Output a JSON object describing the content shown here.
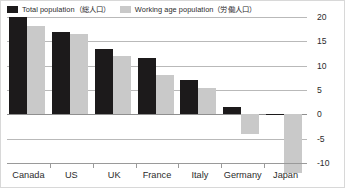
{
  "legend": {
    "position": "top-left",
    "entries": [
      {
        "label": "Total population（総人口）",
        "color": "#1c1a1b",
        "key": "total"
      },
      {
        "label": "Working age population（労働人口）",
        "color": "#c9c9c9",
        "key": "working"
      }
    ]
  },
  "colors": {
    "total": "#1c1a1b",
    "working": "#c9c9c9",
    "gridline": "#b9b9b9",
    "axis": "#9a9a9a",
    "text": "#2b2b2b",
    "background": "#ffffff"
  },
  "chart_data": {
    "type": "bar",
    "title": "",
    "subtitle": "",
    "xlabel": "",
    "ylabel": "",
    "categories": [
      "Canada",
      "US",
      "UK",
      "France",
      "Italy",
      "Germany",
      "Japan"
    ],
    "series": [
      {
        "name": "Total population（総人口）",
        "key": "total",
        "color": "#1c1a1b",
        "values": [
          20,
          17,
          13.5,
          11.5,
          7,
          1.5,
          -0.2
        ]
      },
      {
        "name": "Working age population（労働人口）",
        "key": "working",
        "color": "#c9c9c9",
        "values": [
          18.2,
          16.5,
          12,
          8,
          5.5,
          -4,
          -12
        ]
      }
    ],
    "ylim": [
      -10,
      20
    ],
    "yticks": [
      20,
      15,
      10,
      5,
      0,
      -5,
      -10
    ],
    "ytick_labels": [
      "20",
      "15",
      "10",
      "5",
      "0",
      "-5",
      "-10"
    ],
    "grid": true,
    "grid_axis": "y",
    "legend_position": "top-left"
  }
}
